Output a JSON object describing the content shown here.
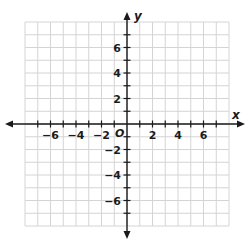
{
  "diagram": {
    "type": "coordinate-plane",
    "x_axis_label": "x",
    "y_axis_label": "y",
    "origin_label": "O",
    "range": {
      "xmin": -8,
      "xmax": 8,
      "ymin": -8,
      "ymax": 8
    },
    "grid_step": 1,
    "label_step": 2,
    "x_tick_labels": [
      "−6",
      "−4",
      "−2",
      "2",
      "4",
      "6"
    ],
    "x_tick_values": [
      -6,
      -4,
      -2,
      2,
      4,
      6
    ],
    "y_tick_labels": [
      "6",
      "4",
      "2",
      "−2",
      "−4",
      "−6"
    ],
    "y_tick_values": [
      6,
      4,
      2,
      -2,
      -4,
      -6
    ],
    "colors": {
      "grid": "#d4d4d4",
      "axis": "#1a1a1a",
      "text": "#1a1a1a",
      "background": "#ffffff"
    }
  }
}
